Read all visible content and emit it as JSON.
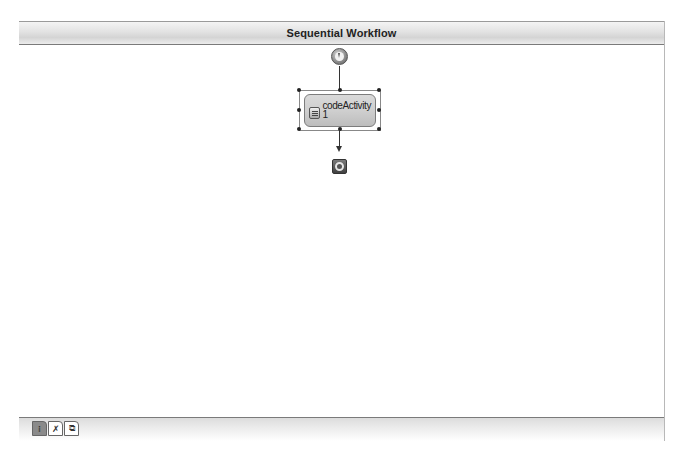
{
  "designer": {
    "title": "Sequential Workflow"
  },
  "workflow": {
    "start_node": {
      "icon": "workflow-start-icon"
    },
    "activities": [
      {
        "name": "codeActivity1",
        "label_line1": "codeActivity",
        "label_line2": "1",
        "icon": "code-activity-icon",
        "selected": true
      }
    ],
    "end_node": {
      "icon": "workflow-end-icon"
    }
  },
  "footer": {
    "view_tabs": [
      {
        "name": "workflow-view",
        "glyph": "⁝",
        "active": true
      },
      {
        "name": "cancel-handlers-view",
        "glyph": "✗",
        "active": false
      },
      {
        "name": "fault-handlers-view",
        "glyph": "⧉",
        "active": false
      }
    ]
  },
  "colors": {
    "header_bg": "#e2e2e2",
    "activity_bg": "#cfcfcf",
    "border": "#7a7a7a"
  }
}
